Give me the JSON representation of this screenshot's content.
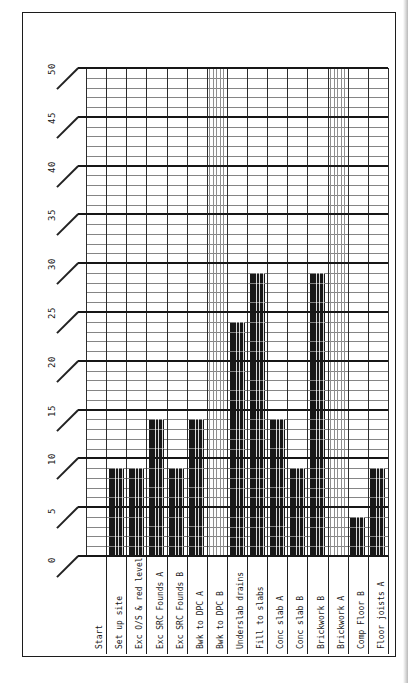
{
  "document": {
    "kind": "scanned construction programme bar chart, page printed rotated 90 degrees",
    "page_background": "#ffffff",
    "border_color": "#1c1c1c"
  },
  "chart_data": {
    "type": "bar",
    "title": "",
    "orientation": "vertical bars rising from baseline; all text (category labels, axis numbers) rotated to read bottom-to-top",
    "categories": [
      "Start",
      "Set up site",
      "Exc O/S & red level",
      "Exc SRC Founds A",
      "Exc SRC Founds B",
      "Bwk to DPC A",
      "Bwk to DPC B",
      "Underslab drains",
      "Fill to slabs",
      "Conc slab A",
      "Conc slab B",
      "Brickwork B",
      "Brickwork A",
      "Comp Floor B",
      "Floor joists A"
    ],
    "values": [
      0,
      9,
      9,
      14,
      9,
      14,
      50,
      24,
      29,
      14,
      9,
      29,
      50,
      4,
      9
    ],
    "bar_hatch": [
      "none",
      "dense",
      "dense",
      "dense",
      "dense",
      "dense",
      "light",
      "dense",
      "dense",
      "dense",
      "dense",
      "dense",
      "light",
      "dense",
      "dense"
    ],
    "ylim": [
      0,
      50
    ],
    "y_ticks": [
      "0",
      "5",
      "10",
      "15",
      "20",
      "25",
      "30",
      "35",
      "40",
      "45",
      "50"
    ],
    "grid": {
      "major_every": 5,
      "minor_every": 1,
      "vertical_per_category": true
    },
    "legend": "none",
    "xlabel": "",
    "ylabel": "",
    "colors": {
      "bar_dense": "#1c1c1c",
      "bar_light": "#8f8f8f",
      "grid_major": "#171717",
      "grid_minor": "#858585",
      "frame": "#1c1c1c"
    }
  }
}
